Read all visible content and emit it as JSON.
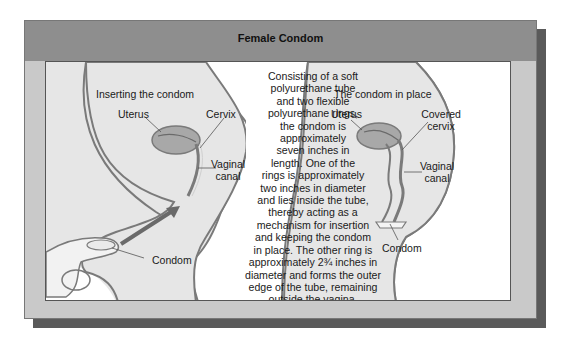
{
  "title": "Female Condom",
  "left_panel": {
    "heading": "Inserting the condom",
    "labels": {
      "uterus": "Uterus",
      "cervix": "Cervix",
      "vaginal_canal_line1": "Vaginal",
      "vaginal_canal_line2": "canal",
      "condom": "Condom"
    }
  },
  "right_panel": {
    "heading": "The condom in place",
    "labels": {
      "uterus": "Uterus",
      "covered_cervix_line1": "Covered",
      "covered_cervix_line2": "cervix",
      "vaginal_canal_line1": "Vaginal",
      "vaginal_canal_line2": "canal",
      "condom": "Condom"
    }
  },
  "description": {
    "lines": [
      "Consisting of a soft",
      "polyurethane tube",
      "and two flexible",
      "polyurethane rings,",
      "the condom is",
      "approximately",
      "seven inches in",
      "length. One of the",
      "rings is approximately",
      "two inches in diameter",
      "and lies inside the tube,",
      "thereby acting as a",
      "mechanism for insertion",
      "and keeping the condom",
      "in place. The other ring is",
      "approximately 2¾ inches in",
      "diameter and forms the outer",
      "edge of the tube, remaining",
      "outside the vagina."
    ]
  },
  "colors": {
    "frame": "#8e8e8e",
    "frame_lower": "#c9c9c9",
    "shadow": "#5a5a5a",
    "body_fill": "#e6e6e6",
    "outline": "#7a7a7a",
    "uterus_fill": "#a8a8a8"
  }
}
